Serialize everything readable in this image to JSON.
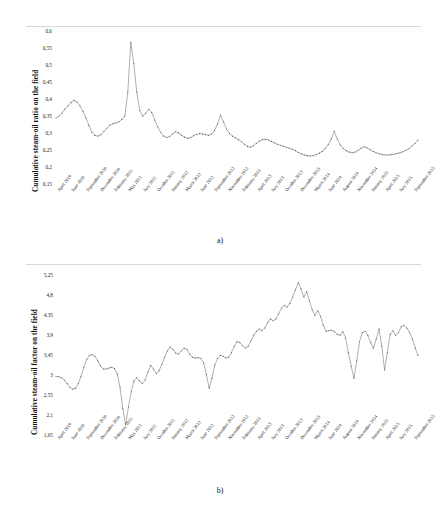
{
  "figure": {
    "panels": [
      {
        "id": "a",
        "caption": "a)",
        "ylabel": "Cumulative steam-oil ratio on the field"
      },
      {
        "id": "b",
        "caption": "b)",
        "ylabel": "Cumulative steam-oil factor on the field"
      }
    ]
  },
  "chart_data": [
    {
      "type": "line",
      "title": "",
      "xlabel": "",
      "ylabel": "Cumulative steam-oil ratio on the field",
      "ylim": [
        0.15,
        0.6
      ],
      "yticks": [
        "0,6",
        "0,55",
        "0,5",
        "0,45",
        "0,4",
        "0,35",
        "0,3",
        "0,25",
        "0,2",
        "0,15"
      ],
      "ytick_values": [
        0.6,
        0.55,
        0.5,
        0.45,
        0.4,
        0.35,
        0.3,
        0.25,
        0.2,
        0.15
      ],
      "grid": false,
      "legend": "none",
      "xtick_labels": [
        "April 2010",
        "June 2010",
        "September 2010",
        "December 2010",
        "February 2011",
        "May 2011",
        "July 2011",
        "October 2011",
        "January 2012",
        "March 2012",
        "June 2012",
        "September 2012",
        "November 2012",
        "February 2013",
        "April 2013",
        "July 2013",
        "October 2013",
        "December 2013",
        "March 2014",
        "June 2014",
        "August 2014",
        "November 2014",
        "January 2015",
        "April 2015",
        "July 2015",
        "September 2015"
      ],
      "values": [
        0.347,
        0.352,
        0.361,
        0.372,
        0.381,
        0.39,
        0.397,
        0.392,
        0.381,
        0.366,
        0.347,
        0.326,
        0.307,
        0.298,
        0.296,
        0.3,
        0.309,
        0.318,
        0.327,
        0.331,
        0.333,
        0.336,
        0.343,
        0.352,
        0.42,
        0.56,
        0.5,
        0.42,
        0.368,
        0.352,
        0.36,
        0.372,
        0.362,
        0.341,
        0.322,
        0.306,
        0.296,
        0.292,
        0.295,
        0.302,
        0.308,
        0.305,
        0.298,
        0.293,
        0.29,
        0.292,
        0.297,
        0.301,
        0.303,
        0.302,
        0.3,
        0.298,
        0.302,
        0.312,
        0.33,
        0.355,
        0.336,
        0.316,
        0.303,
        0.296,
        0.291,
        0.286,
        0.28,
        0.273,
        0.267,
        0.265,
        0.269,
        0.276,
        0.282,
        0.286,
        0.287,
        0.285,
        0.281,
        0.277,
        0.273,
        0.27,
        0.267,
        0.264,
        0.262,
        0.259,
        0.255,
        0.25,
        0.246,
        0.243,
        0.241,
        0.24,
        0.241,
        0.244,
        0.248,
        0.253,
        0.261,
        0.272,
        0.288,
        0.31,
        0.288,
        0.271,
        0.261,
        0.255,
        0.251,
        0.249,
        0.251,
        0.256,
        0.262,
        0.266,
        0.263,
        0.258,
        0.253,
        0.249,
        0.246,
        0.244,
        0.243,
        0.243,
        0.244,
        0.245,
        0.247,
        0.249,
        0.252,
        0.256,
        0.261,
        0.268,
        0.276,
        0.285
      ]
    },
    {
      "type": "line",
      "title": "",
      "xlabel": "",
      "ylabel": "Cumulative steam-oil factor on the field",
      "ylim": [
        1.65,
        5.25
      ],
      "yticks": [
        "5,25",
        "4,8",
        "4,35",
        "3,9",
        "3,45",
        "3",
        "2,55",
        "2,1",
        "1,65"
      ],
      "ytick_values": [
        5.25,
        4.8,
        4.35,
        3.9,
        3.45,
        3.0,
        2.55,
        2.1,
        1.65
      ],
      "grid": false,
      "legend": "none",
      "xtick_labels": [
        "April 2010",
        "June 2010",
        "September 2010",
        "December 2010",
        "February 2011",
        "May 2011",
        "July 2011",
        "October 2011",
        "January 2012",
        "March 2012",
        "June 2012",
        "September 2012",
        "November 2012",
        "February 2013",
        "April 2013",
        "July 2013",
        "October 2013",
        "December 2013",
        "March 2014",
        "June 2014",
        "August 2014",
        "November 2014",
        "January 2015",
        "April 2015",
        "July 2015",
        "September 2015"
      ],
      "values": [
        2.96,
        2.95,
        2.93,
        2.88,
        2.8,
        2.72,
        2.68,
        2.7,
        2.8,
        2.96,
        3.16,
        3.33,
        3.42,
        3.44,
        3.4,
        3.3,
        3.19,
        3.12,
        3.12,
        3.14,
        3.16,
        3.13,
        3.01,
        2.72,
        2.25,
        1.9,
        2.28,
        2.62,
        2.86,
        2.93,
        2.86,
        2.8,
        2.88,
        3.05,
        3.2,
        3.12,
        3.02,
        3.08,
        3.22,
        3.38,
        3.52,
        3.6,
        3.55,
        3.47,
        3.45,
        3.52,
        3.58,
        3.55,
        3.45,
        3.38,
        3.36,
        3.37,
        3.35,
        3.26,
        3.0,
        2.7,
        2.92,
        3.2,
        3.35,
        3.42,
        3.4,
        3.36,
        3.38,
        3.48,
        3.62,
        3.72,
        3.7,
        3.63,
        3.58,
        3.62,
        3.74,
        3.86,
        3.95,
        4.0,
        3.96,
        4.02,
        4.14,
        4.22,
        4.18,
        4.22,
        4.34,
        4.46,
        4.52,
        4.48,
        4.56,
        4.7,
        4.86,
        5.02,
        4.88,
        4.7,
        4.82,
        4.62,
        4.42,
        4.3,
        4.4,
        4.28,
        4.08,
        3.95,
        3.96,
        3.97,
        3.94,
        3.88,
        3.86,
        3.94,
        3.8,
        3.48,
        3.18,
        2.92,
        3.3,
        3.72,
        3.92,
        3.95,
        3.86,
        3.7,
        3.58,
        3.78,
        4.0,
        3.62,
        3.1,
        3.48,
        3.88,
        3.96,
        3.86,
        3.92,
        4.05,
        4.08,
        4.02,
        3.92,
        3.78,
        3.58,
        3.42
      ]
    }
  ]
}
